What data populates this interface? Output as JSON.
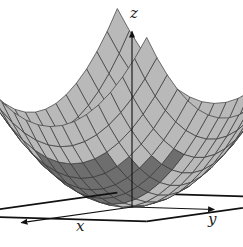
{
  "figure": {
    "type": "3d-surface",
    "function": "z = x^2 + y^2",
    "colors": {
      "background": "#ffffff",
      "surface_fill": "#b9b9b9",
      "surface_fill_dark": "#6e6e6e",
      "mesh_line": "#3a3a3a",
      "axis": "#111111",
      "plane": "#111111"
    },
    "grid_divisions": 16
  },
  "axes": {
    "x": {
      "label": "x"
    },
    "y": {
      "label": "y"
    },
    "z": {
      "label": "z"
    }
  },
  "base_plane": {
    "shape": "square",
    "corners_px": [
      [
        20,
        203
      ],
      [
        75,
        183
      ],
      [
        228,
        190
      ],
      [
        155,
        225
      ]
    ]
  }
}
